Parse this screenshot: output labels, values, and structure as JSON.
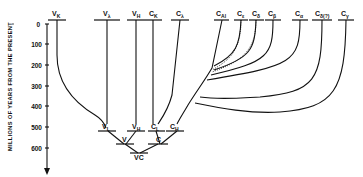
{
  "axis": {
    "title": "MILLIONS OF YEARS FROM THE PRESENT",
    "ticks": [
      "0",
      "100",
      "200",
      "300",
      "400",
      "500",
      "600"
    ]
  },
  "top_genes": [
    {
      "base": "V",
      "sub": "K"
    },
    {
      "base": "V",
      "sub": "λ"
    },
    {
      "base": "V",
      "sub": "H"
    },
    {
      "base": "C",
      "sub": "K"
    },
    {
      "base": "C",
      "sub": "λ"
    },
    {
      "base": "C",
      "sub": "Al"
    },
    {
      "base": "C",
      "sub": "ε"
    },
    {
      "base": "C",
      "sub": "δ"
    },
    {
      "base": "C",
      "sub": "β"
    },
    {
      "base": "C",
      "sub": "α"
    },
    {
      "base": "C",
      "sub": "δ(?)"
    },
    {
      "base": "C",
      "sub": "γ"
    }
  ],
  "ancestral_nodes": [
    {
      "base": "V",
      "sub": "L"
    },
    {
      "base": "V",
      "sub": "H"
    },
    {
      "base": "C",
      "sub": "L"
    },
    {
      "base": "C",
      "sub": "H"
    },
    {
      "base": "V",
      "sub": ""
    },
    {
      "base": "C",
      "sub": ""
    },
    {
      "base": "VC",
      "sub": ""
    }
  ]
}
